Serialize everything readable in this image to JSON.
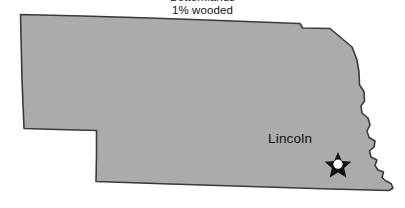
{
  "figure": {
    "name": "nebraska-state-map",
    "caption_lines": [
      "Bottomlands",
      "1% wooded"
    ]
  },
  "map": {
    "state_name": "Nebraska",
    "fill_color": "#ababab",
    "border_color": "#3a3a3a",
    "background_color": "#ffffff",
    "cities": [
      {
        "label": "Lincoln",
        "marker": "capital-star",
        "marker_fill": "#111111",
        "marker_center_fill": "#ffffff"
      }
    ]
  }
}
